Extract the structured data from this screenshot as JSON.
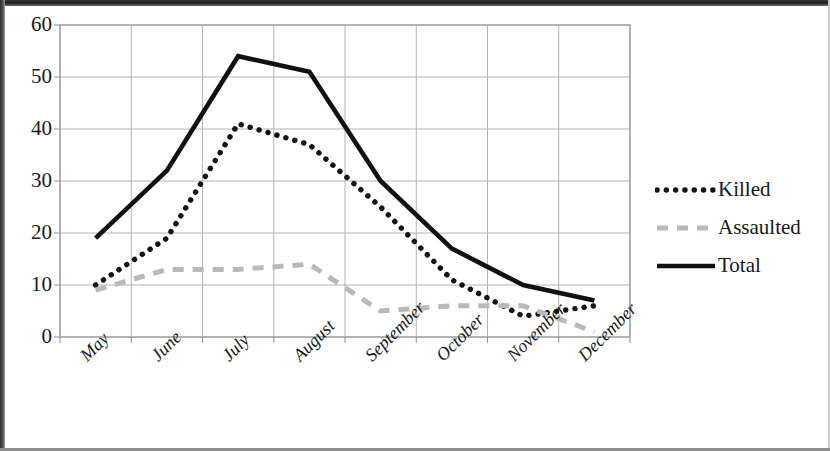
{
  "chart_data": {
    "type": "line",
    "title": "",
    "xlabel": "",
    "ylabel": "",
    "categories": [
      "May",
      "June",
      "July",
      "August",
      "September",
      "October",
      "November",
      "December"
    ],
    "series": [
      {
        "name": "Killed",
        "style": "dotted",
        "color": "#141414",
        "values": [
          10,
          19,
          41,
          37,
          25,
          11,
          4,
          6
        ]
      },
      {
        "name": "Assaulted",
        "style": "dashed",
        "color": "#b9b9b9",
        "values": [
          9,
          13,
          13,
          14,
          5,
          6,
          6,
          1
        ]
      },
      {
        "name": "Total",
        "style": "solid",
        "color": "#111111",
        "values": [
          19,
          32,
          54,
          51,
          30,
          17,
          10,
          7
        ]
      }
    ],
    "ylim": [
      0,
      60
    ],
    "yticks": [
      0,
      10,
      20,
      30,
      40,
      50,
      60
    ],
    "ytick_labels": [
      "0",
      "10",
      "20",
      "30",
      "40",
      "50",
      "60"
    ],
    "grid": true,
    "grid_axis": "both",
    "legend_position": "right",
    "legend": [
      "Killed",
      "Assaulted",
      "Total"
    ],
    "plot_border": true
  },
  "axes": {
    "y_labels": [
      "60",
      "50",
      "40",
      "30",
      "20",
      "10",
      "0"
    ],
    "x_labels": [
      "May",
      "June",
      "July",
      "August",
      "September",
      "October",
      "November",
      "December"
    ]
  },
  "legend": {
    "items": [
      {
        "label": "Killed",
        "sample": "dotted-line-sample"
      },
      {
        "label": "Assaulted",
        "sample": "dashed-line-sample"
      },
      {
        "label": "Total",
        "sample": "solid-line-sample"
      }
    ]
  }
}
